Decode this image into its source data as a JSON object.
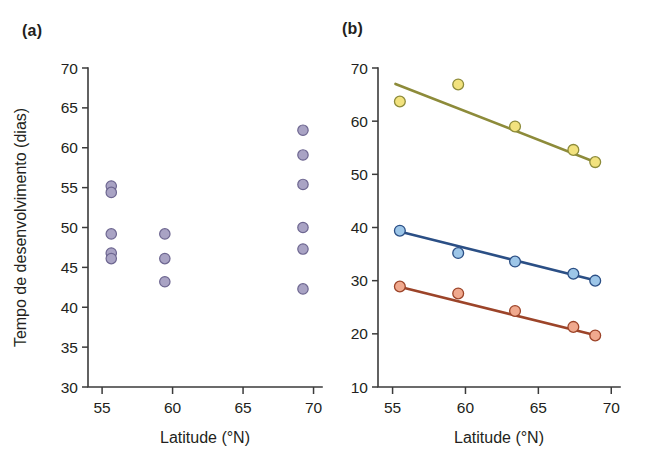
{
  "figure": {
    "background": "#ffffff",
    "panels": [
      {
        "id": "a",
        "label": "(a)"
      },
      {
        "id": "b",
        "label": "(b)"
      }
    ]
  },
  "chart_data": [
    {
      "panel": "a",
      "type": "scatter",
      "title": "",
      "xlabel": "Latitude (°N)",
      "ylabel": "Tempo de desenvolvimento (dias)",
      "xlim": [
        54.0,
        70.6
      ],
      "ylim": [
        30,
        70
      ],
      "xticks": [
        55,
        60,
        65,
        70
      ],
      "xticklabels": [
        "55",
        "60",
        "65",
        "70"
      ],
      "yticks": [
        30,
        35,
        40,
        45,
        50,
        55,
        60,
        65,
        70
      ],
      "yticklabels": [
        "30",
        "35",
        "40",
        "45",
        "50",
        "55",
        "60",
        "65",
        "70"
      ],
      "grid": false,
      "legend": "none",
      "marker": {
        "fill": "#a9a3c4",
        "stroke": "#6d6690",
        "shape": "circle"
      },
      "series": [
        {
          "name": "Tempo de desenvolvimento",
          "points": [
            {
              "x": 55.65,
              "y": 55.2
            },
            {
              "x": 55.65,
              "y": 54.4
            },
            {
              "x": 55.65,
              "y": 49.2
            },
            {
              "x": 55.65,
              "y": 46.8
            },
            {
              "x": 55.65,
              "y": 46.1
            },
            {
              "x": 59.45,
              "y": 49.2
            },
            {
              "x": 59.45,
              "y": 46.1
            },
            {
              "x": 59.45,
              "y": 43.2
            },
            {
              "x": 69.25,
              "y": 62.2
            },
            {
              "x": 69.25,
              "y": 59.1
            },
            {
              "x": 69.25,
              "y": 55.4
            },
            {
              "x": 69.25,
              "y": 50.0
            },
            {
              "x": 69.25,
              "y": 47.3
            },
            {
              "x": 69.25,
              "y": 42.3
            }
          ]
        }
      ]
    },
    {
      "panel": "b",
      "type": "scatter",
      "title": "",
      "xlabel": "Latitude (°N)",
      "ylabel": "",
      "xlim": [
        54.0,
        70.6
      ],
      "ylim": [
        10,
        70
      ],
      "xticks": [
        55,
        60,
        65,
        70
      ],
      "xticklabels": [
        "55",
        "60",
        "65",
        "70"
      ],
      "yticks": [
        10,
        20,
        30,
        40,
        50,
        60,
        70
      ],
      "yticklabels": [
        "10",
        "20",
        "30",
        "40",
        "50",
        "60",
        "70"
      ],
      "grid": false,
      "legend": "none",
      "series": [
        {
          "name": "serie-amarela",
          "color_fill": "#f2e27e",
          "color_stroke": "#8d8b3a",
          "x": [
            55.5,
            59.5,
            63.4,
            67.4,
            68.9
          ],
          "values": [
            63.7,
            66.9,
            59.0,
            54.6,
            52.3
          ],
          "fit_line": {
            "x0": 55.2,
            "y0": 67.0,
            "x1": 69.1,
            "y1": 52.1
          }
        },
        {
          "name": "serie-azul",
          "color_fill": "#9dc6e8",
          "color_stroke": "#2b4f85",
          "x": [
            55.5,
            59.5,
            63.4,
            67.4,
            68.9
          ],
          "values": [
            39.4,
            35.2,
            33.6,
            31.3,
            30.0
          ],
          "fit_line": {
            "x0": 55.4,
            "y0": 39.3,
            "x1": 69.0,
            "y1": 30.0
          }
        },
        {
          "name": "serie-vermelha",
          "color_fill": "#f0a98e",
          "color_stroke": "#9c4429",
          "x": [
            55.5,
            59.5,
            63.4,
            67.4,
            68.9
          ],
          "values": [
            28.9,
            27.6,
            24.3,
            21.3,
            19.7
          ],
          "fit_line": {
            "x0": 55.4,
            "y0": 28.9,
            "x1": 69.0,
            "y1": 19.7
          }
        }
      ]
    }
  ]
}
